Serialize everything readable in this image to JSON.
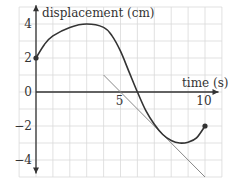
{
  "chart_data": {
    "type": "line",
    "title": "",
    "xlabel": "time (s)",
    "ylabel": "displacement (cm)",
    "xlim": [
      0,
      11
    ],
    "ylim": [
      -5,
      5
    ],
    "grid": true,
    "x_ticks": [
      {
        "value": 5,
        "label": "5"
      },
      {
        "value": 10,
        "label": "10"
      }
    ],
    "y_ticks": [
      {
        "value": 4,
        "label": "4"
      },
      {
        "value": 2,
        "label": "2"
      },
      {
        "value": 0,
        "label": "0"
      },
      {
        "value": -2,
        "label": "−2"
      },
      {
        "value": -4,
        "label": "−4"
      }
    ],
    "series": [
      {
        "name": "displacement curve",
        "x": [
          0,
          0.5,
          1,
          2,
          3,
          4,
          4.5,
          5,
          5.5,
          6,
          6.5,
          7,
          7.5,
          8,
          8.5,
          9,
          9.5,
          10
        ],
        "y": [
          2,
          2.8,
          3.3,
          3.8,
          4.0,
          3.8,
          3.3,
          2.4,
          1.2,
          0,
          -1.1,
          -1.9,
          -2.5,
          -2.85,
          -3.0,
          -2.95,
          -2.7,
          -2
        ],
        "endpoints": [
          {
            "x": 0,
            "y": 2
          },
          {
            "x": 10,
            "y": -2
          }
        ]
      },
      {
        "name": "tangent line",
        "x": [
          4,
          10
        ],
        "y": [
          1,
          -5
        ]
      }
    ]
  }
}
